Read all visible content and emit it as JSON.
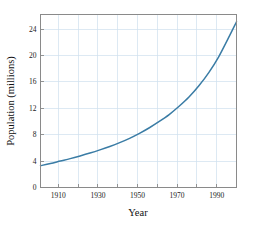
{
  "chart_data": {
    "type": "line",
    "title": "",
    "xlabel": "Year",
    "ylabel": "Population (millions)",
    "xlim": [
      1901,
      2000
    ],
    "ylim": [
      0,
      26.2
    ],
    "grid": true,
    "legend": null,
    "x_ticks": [
      1910,
      1930,
      1950,
      1970,
      1990
    ],
    "x_tick_labels": [
      "1910",
      "1930",
      "1950",
      "1970",
      "1990"
    ],
    "x_gridlines": [
      1910,
      1920,
      1930,
      1940,
      1950,
      1960,
      1970,
      1980,
      1990,
      2000
    ],
    "y_ticks": [
      0,
      4,
      8,
      12,
      16,
      20,
      24
    ],
    "y_tick_labels": [
      "0",
      "4",
      "8",
      "12",
      "16",
      "20",
      "24"
    ],
    "y_gridlines": [
      4,
      8,
      12,
      16,
      20,
      24
    ],
    "series": [
      {
        "name": "Population",
        "color": "#3a7ca5",
        "x": [
          1901,
          1906,
          1911,
          1916,
          1921,
          1926,
          1931,
          1936,
          1941,
          1946,
          1951,
          1956,
          1961,
          1966,
          1971,
          1976,
          1981,
          1986,
          1991,
          1996,
          2000
        ],
        "values": [
          3.3,
          3.63,
          4.0,
          4.37,
          4.78,
          5.22,
          5.7,
          6.22,
          6.8,
          7.45,
          8.2,
          9.05,
          10.0,
          11.05,
          12.3,
          13.7,
          15.4,
          17.4,
          19.8,
          22.7,
          25.1
        ]
      }
    ]
  },
  "axis_text": {
    "x_title": "Year",
    "y_title": "Population (millions)"
  },
  "colors": {
    "line": "#3a7ca5",
    "grid": "#cfe0ee",
    "frame": "#8a8a8a",
    "text": "#1a1a1a",
    "background": "#ffffff"
  }
}
